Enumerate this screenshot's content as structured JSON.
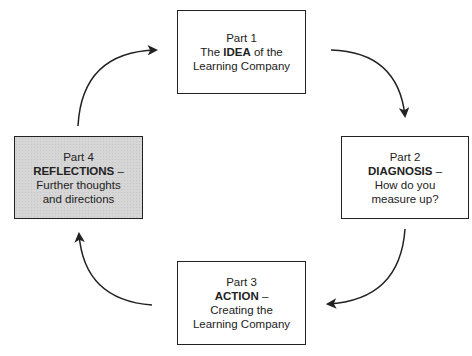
{
  "diagram": {
    "type": "cycle",
    "parts": [
      {
        "id": 1,
        "label": "Part 1",
        "line2_pre": "The ",
        "keyword": "IDEA",
        "line2_post": " of the",
        "rest": [
          "Learning Company"
        ],
        "shaded": false
      },
      {
        "id": 2,
        "label": "Part 2",
        "line2_pre": "",
        "keyword": "DIAGNOSIS",
        "line2_post": " –",
        "rest": [
          "How do you",
          "measure up?"
        ],
        "shaded": false
      },
      {
        "id": 3,
        "label": "Part 3",
        "line2_pre": "",
        "keyword": "ACTION",
        "line2_post": " –",
        "rest": [
          "Creating the",
          "Learning Company"
        ],
        "shaded": false
      },
      {
        "id": 4,
        "label": "Part 4",
        "line2_pre": "",
        "keyword": "REFLECTIONS",
        "line2_post": " –",
        "rest": [
          "Further thoughts",
          "and directions"
        ],
        "shaded": true
      }
    ],
    "arrows": [
      {
        "from": 1,
        "to": 2,
        "direction": "clockwise"
      },
      {
        "from": 2,
        "to": 3,
        "direction": "clockwise"
      },
      {
        "from": 3,
        "to": 4,
        "direction": "clockwise"
      },
      {
        "from": 4,
        "to": 1,
        "direction": "clockwise"
      }
    ],
    "colors": {
      "stroke": "#222222",
      "shade": "#d6d6d6",
      "background": "#ffffff"
    }
  }
}
